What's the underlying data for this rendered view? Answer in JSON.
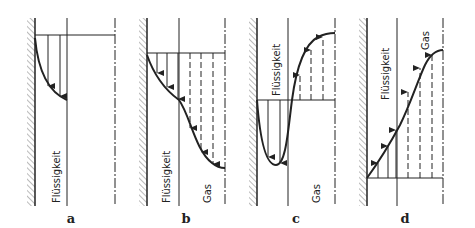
{
  "panels": [
    {
      "id": "a",
      "letter": "a",
      "liquid_label": "Flüssigkeit",
      "gas_label": ""
    },
    {
      "id": "b",
      "letter": "b",
      "liquid_label": "Flüssigkeit",
      "gas_label": "Gas"
    },
    {
      "id": "c",
      "letter": "c",
      "liquid_label": "Flüssigkeit",
      "gas_label": "Gas"
    },
    {
      "id": "d",
      "letter": "d",
      "liquid_label": "Flüssigkeit",
      "gas_label": "Gas"
    }
  ],
  "colors": {
    "ink": "#222222",
    "background": "#ffffff"
  }
}
